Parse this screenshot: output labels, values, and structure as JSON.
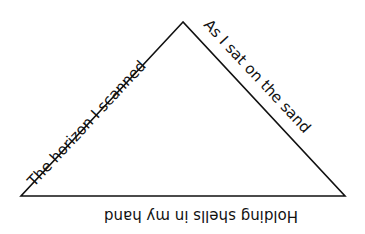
{
  "poem": {
    "left_side": "The horizon I scanned",
    "right_side": "As I sat on the sand",
    "bottom_side": "Holding shells in my hand"
  },
  "shape": {
    "type": "triangle",
    "apex": [
      183,
      22
    ],
    "left": [
      21,
      196
    ],
    "right": [
      345,
      196
    ],
    "stroke_color": "#111111",
    "background": "#ffffff"
  }
}
